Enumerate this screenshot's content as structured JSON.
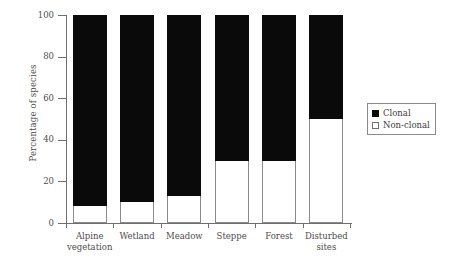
{
  "chart_data": {
    "type": "bar",
    "subtype": "stacked-100-percent",
    "title": "",
    "xlabel": "",
    "ylabel": "Percentage of species",
    "ylim": [
      0,
      100
    ],
    "yticks": [
      0,
      20,
      40,
      60,
      80,
      100
    ],
    "ytick_labels": [
      "0",
      "20",
      "40",
      "60",
      "80",
      "100"
    ],
    "grid": false,
    "legend_position": "right",
    "categories": [
      "Alpine vegetation",
      "Wetland",
      "Meadow",
      "Steppe",
      "Forest",
      "Disturbed sites"
    ],
    "category_lines": [
      [
        "Alpine",
        "vegetation"
      ],
      [
        "Wetland",
        ""
      ],
      [
        "Meadow",
        ""
      ],
      [
        "Steppe",
        ""
      ],
      [
        "Forest",
        ""
      ],
      [
        "Disturbed",
        "sites"
      ]
    ],
    "series": [
      {
        "name": "Clonal",
        "color": "#0a0a0a",
        "values": [
          92,
          90,
          87,
          70,
          70,
          50
        ]
      },
      {
        "name": "Non-clonal",
        "color": "#ffffff",
        "values": [
          8,
          10,
          13,
          30,
          30,
          50
        ]
      }
    ]
  },
  "legend": {
    "entries": [
      {
        "label": "Clonal",
        "swatch": "filled-square-icon"
      },
      {
        "label": "Non-clonal",
        "swatch": "hollow-square-icon"
      }
    ]
  },
  "axes": {
    "y_title": "Percentage of species"
  }
}
